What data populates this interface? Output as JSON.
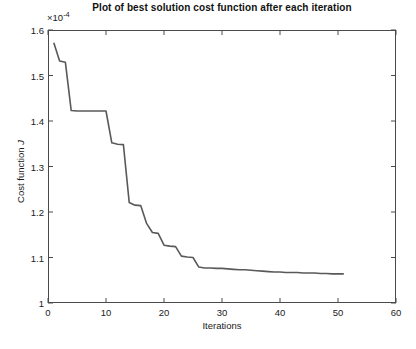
{
  "chart_data": {
    "type": "line",
    "title": "Plot of best solution cost function after each iteration",
    "xlabel": "Iterations",
    "ylabel": "Cost function J",
    "ylabel_main": "Cost function",
    "ylabel_symbol": "J",
    "y_exponent_label": "×10",
    "y_exponent_value": "-4",
    "y_scale": 0.0001,
    "xlim": [
      0,
      60
    ],
    "ylim": [
      1.0,
      1.6
    ],
    "xticks": [
      0,
      10,
      20,
      30,
      40,
      50,
      60
    ],
    "xticklabels": [
      "0",
      "10",
      "20",
      "30",
      "40",
      "50",
      "60"
    ],
    "yticks": [
      1,
      1.1,
      1.2,
      1.3,
      1.4,
      1.5,
      1.6
    ],
    "yticklabels": [
      "1",
      "1.1",
      "1.2",
      "1.3",
      "1.4",
      "1.5",
      "1.6"
    ],
    "grid": false,
    "legend": null,
    "line_color": "#595959",
    "line_width": 1.6,
    "background_color": "#ffffff",
    "axes_color": "#4a4a4a",
    "series": [
      {
        "name": "best solution cost",
        "x": [
          1,
          2,
          3,
          4,
          5,
          6,
          7,
          8,
          9,
          10,
          11,
          12,
          13,
          14,
          15,
          16,
          17,
          18,
          19,
          20,
          21,
          22,
          23,
          24,
          25,
          26,
          27,
          28,
          29,
          30,
          31,
          32,
          33,
          34,
          35,
          36,
          37,
          38,
          39,
          40,
          41,
          42,
          43,
          44,
          45,
          46,
          47,
          48,
          49,
          50,
          51
        ],
        "y": [
          1.572,
          1.532,
          1.529,
          1.423,
          1.422,
          1.422,
          1.422,
          1.422,
          1.422,
          1.422,
          1.352,
          1.349,
          1.348,
          1.221,
          1.215,
          1.214,
          1.175,
          1.155,
          1.153,
          1.127,
          1.125,
          1.124,
          1.103,
          1.101,
          1.1,
          1.079,
          1.077,
          1.077,
          1.076,
          1.076,
          1.075,
          1.074,
          1.073,
          1.073,
          1.072,
          1.071,
          1.07,
          1.069,
          1.068,
          1.068,
          1.067,
          1.067,
          1.067,
          1.066,
          1.066,
          1.066,
          1.065,
          1.065,
          1.064,
          1.064,
          1.064
        ]
      }
    ]
  }
}
